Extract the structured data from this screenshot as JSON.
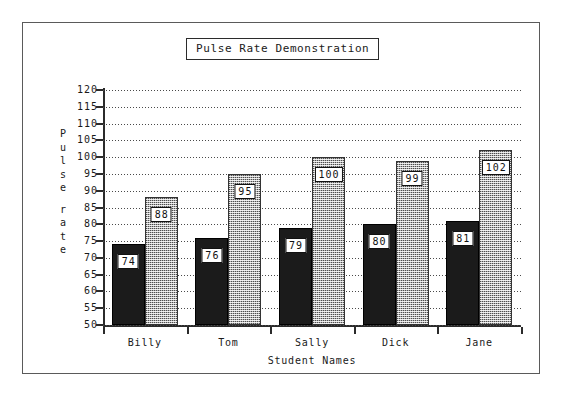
{
  "chart_data": {
    "type": "bar",
    "title": "Pulse Rate Demonstration",
    "xlabel": "Student Names",
    "ylabel": "Pulse rate",
    "ylabel_letters": [
      "P",
      "u",
      "l",
      "s",
      "e",
      "",
      "r",
      "a",
      "t",
      "e"
    ],
    "categories": [
      "Billy",
      "Tom",
      "Sally",
      "Dick",
      "Jane"
    ],
    "series": [
      {
        "name": "Resting pulse rate",
        "style": "solid-black",
        "values": [
          74,
          76,
          79,
          80,
          81
        ]
      },
      {
        "name": "Active pulse rate",
        "style": "gray-dither",
        "values": [
          88,
          95,
          100,
          99,
          102
        ]
      }
    ],
    "ylim": [
      50,
      120
    ],
    "ytick_step": 5,
    "yticks": [
      50,
      55,
      60,
      65,
      70,
      75,
      80,
      85,
      90,
      95,
      100,
      105,
      110,
      115,
      120
    ],
    "grid": true,
    "grid_style": "dotted-horizontal",
    "legend": "none",
    "value_labels": true,
    "colors": {
      "series_1": "#1b1b1b",
      "series_2": "#b2b2b2",
      "axis": "#2b2b2b",
      "grid": "#4a4a4a",
      "text": "#1a1a1a",
      "background": "#ffffff",
      "frame": "#5a5a5a"
    }
  }
}
